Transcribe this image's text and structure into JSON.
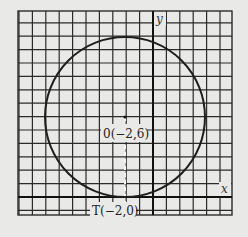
{
  "figure": {
    "axes": {
      "x_label": "x",
      "y_label": "y"
    },
    "grid": {
      "x_min": -9,
      "x_max": 7,
      "y_min": -1.5,
      "y_max": 13.5,
      "step": 1
    },
    "circle": {
      "center_label": "0(−2,6)",
      "center": [
        -2,
        6
      ],
      "radius": 6
    },
    "tangent_point": {
      "label": "T(−2,0)",
      "point": [
        -2,
        0
      ]
    },
    "colors": {
      "background": "#e9e9e7",
      "grid": "#2b2b2b",
      "curve": "#1e1e1e"
    }
  }
}
